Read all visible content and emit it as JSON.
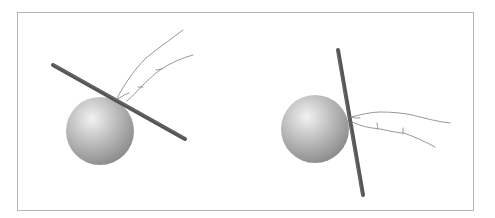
{
  "figure": {
    "colors": {
      "frame": "#b5b5b5",
      "rod": "#555555",
      "rod_highlight": "#7a7a7a",
      "ball_light": "#f2f2f2",
      "ball_mid": "#b8b8b8",
      "ball_dark": "#8a8a8a",
      "finger_line": "#8c8c8c"
    },
    "panels": [
      {
        "name": "left-panel",
        "ball": {
          "cx": 100,
          "cy": 131,
          "r": 34
        },
        "rod": {
          "x1": 53,
          "y1": 65,
          "x2": 185,
          "y2": 139
        },
        "finger": "tilted-rod-pressed-from-above"
      },
      {
        "name": "right-panel",
        "ball": {
          "cx": 315,
          "cy": 129,
          "r": 34
        },
        "rod": {
          "x1": 338,
          "y1": 50,
          "x2": 363,
          "y2": 195
        },
        "finger": "near-vertical-rod-pressed-from-side"
      }
    ]
  }
}
